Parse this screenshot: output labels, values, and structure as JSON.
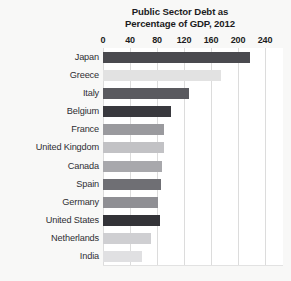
{
  "chart_data": {
    "type": "bar",
    "orientation": "horizontal",
    "title": "Public Sector Debt as Percentage of GDP, 2012",
    "title_lines": [
      "Public Sector Debt as",
      "Percentage of GDP, 2012"
    ],
    "xlabel": "",
    "ylabel": "",
    "xlim": [
      0,
      240
    ],
    "xticks": [
      0,
      40,
      80,
      120,
      160,
      200,
      240
    ],
    "xtick_labels": [
      "0",
      "40",
      "80",
      "120",
      "160",
      "200",
      "240"
    ],
    "grid": true,
    "grid_axis": "x",
    "legend": "none",
    "categories": [
      "Japan",
      "Greece",
      "Italy",
      "Belgium",
      "France",
      "United Kingdom",
      "Canada",
      "Spain",
      "Germany",
      "United States",
      "Netherlands",
      "India"
    ],
    "values": [
      218,
      175,
      127,
      100,
      90,
      90,
      87,
      86,
      82,
      85,
      71,
      58
    ],
    "bar_colors": [
      "#4a4a4f",
      "#e2e2e2",
      "#5a5a5f",
      "#39393e",
      "#9a9a9e",
      "#c2c2c5",
      "#a8a8ac",
      "#6f6f74",
      "#8f8f94",
      "#333338",
      "#cfcfd2",
      "#e0e0e2"
    ],
    "bars": [
      {
        "category": "Japan",
        "value": 218,
        "color": "#4a4a4f"
      },
      {
        "category": "Greece",
        "value": 175,
        "color": "#e2e2e2"
      },
      {
        "category": "Italy",
        "value": 127,
        "color": "#5a5a5f"
      },
      {
        "category": "Belgium",
        "value": 100,
        "color": "#39393e"
      },
      {
        "category": "France",
        "value": 90,
        "color": "#9a9a9e"
      },
      {
        "category": "United Kingdom",
        "value": 90,
        "color": "#c2c2c5"
      },
      {
        "category": "Canada",
        "value": 87,
        "color": "#a8a8ac"
      },
      {
        "category": "Spain",
        "value": 86,
        "color": "#6f6f74"
      },
      {
        "category": "Germany",
        "value": 82,
        "color": "#8f8f94"
      },
      {
        "category": "United States",
        "value": 85,
        "color": "#333338"
      },
      {
        "category": "Netherlands",
        "value": 71,
        "color": "#cfcfd2"
      },
      {
        "category": "India",
        "value": 58,
        "color": "#e0e0e2"
      }
    ]
  },
  "style": {
    "page_background": "#f8f8f7",
    "plot_background": "#ffffff",
    "gridline_color": "#dcdcdc",
    "title_color": "#1c1c22",
    "label_color": "#2e2e33"
  }
}
